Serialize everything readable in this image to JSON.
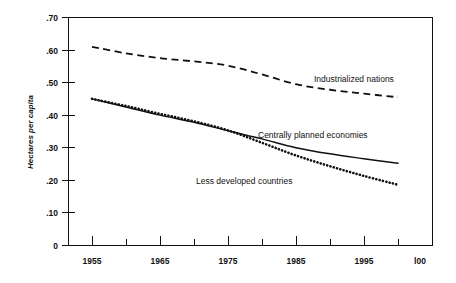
{
  "chart_data": {
    "type": "line",
    "title": "",
    "xlabel": "",
    "ylabel": "Hectares per capita",
    "xlim": [
      1955,
      2000
    ],
    "ylim": [
      0,
      0.7
    ],
    "grid": false,
    "legend_position": "inline-annotations",
    "x_ticks": [
      1955,
      1960,
      1965,
      1970,
      1975,
      1980,
      1985,
      1990,
      1995,
      2000
    ],
    "x_tick_labels": [
      "1955",
      "",
      "1965",
      "",
      "1975",
      "",
      "1985",
      "",
      "1995",
      "l00"
    ],
    "y_ticks": [
      0,
      0.1,
      0.2,
      0.3,
      0.4,
      0.5,
      0.6,
      0.7
    ],
    "y_tick_labels": [
      "0",
      ".10",
      ".20",
      ".30",
      ".40",
      ".50",
      ".60",
      ".70"
    ],
    "x": [
      1955,
      1960,
      1965,
      1970,
      1975,
      1980,
      1985,
      1990,
      1995,
      2000
    ],
    "series": [
      {
        "name": "Industrialized nations",
        "style": "dashed",
        "color": "#111111",
        "values": [
          0.61,
          0.59,
          0.575,
          0.565,
          0.552,
          0.525,
          0.495,
          0.478,
          0.466,
          0.455
        ]
      },
      {
        "name": "Centrally planned economies",
        "style": "solid",
        "color": "#111111",
        "values": [
          0.45,
          0.425,
          0.4,
          0.378,
          0.352,
          0.327,
          0.3,
          0.281,
          0.266,
          0.252
        ]
      },
      {
        "name": "Less developed countries",
        "style": "dotted",
        "color": "#111111",
        "values": [
          0.45,
          0.428,
          0.404,
          0.381,
          0.353,
          0.315,
          0.276,
          0.243,
          0.213,
          0.186
        ]
      }
    ],
    "annotations": [
      {
        "text": "Industrialized nations",
        "x": 1986,
        "y": 0.515
      },
      {
        "text": "Centrally planned economies",
        "x": 1980,
        "y": 0.335
      },
      {
        "text": "Less developed countries",
        "x": 1971,
        "y": 0.215
      }
    ]
  },
  "axis": {
    "y_title": "Hectares per capita"
  },
  "y_labels": {
    "t0": ".70",
    "t1": ".60",
    "t2": ".50",
    "t3": ".40",
    "t4": ".30",
    "t5": ".20",
    "t6": ".10",
    "t7": "0"
  },
  "x_labels": {
    "t0": "1955",
    "t1": "1965",
    "t2": "1975",
    "t3": "1985",
    "t4": "1995",
    "t5": "l00"
  },
  "series_labels": {
    "industrialized": "Industrialized nations",
    "centrally_planned": "Centrally planned economies",
    "less_developed": "Less developed countries"
  }
}
